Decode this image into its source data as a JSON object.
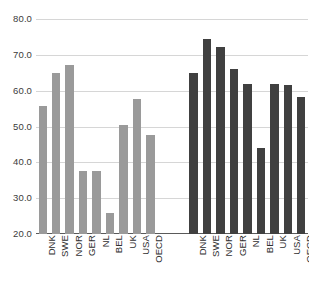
{
  "chart_data": {
    "type": "bar",
    "title": "",
    "subtitle": "",
    "xlabel": "",
    "ylabel": "",
    "ylim": [
      20.0,
      80.0
    ],
    "yticks": [
      "20.0",
      "30.0",
      "40.0",
      "50.0",
      "60.0",
      "70.0",
      "80.0"
    ],
    "ytick_values": [
      20.0,
      30.0,
      40.0,
      50.0,
      60.0,
      70.0,
      80.0
    ],
    "grid": true,
    "legend": "none",
    "categories": [
      "DNK",
      "SWE",
      "NOR",
      "GER",
      "NL",
      "BEL",
      "UK",
      "USA",
      "OECD"
    ],
    "series": [
      {
        "name": "group-1",
        "color": "#9a9a9a",
        "values": [
          55.7,
          65.0,
          67.2,
          37.6,
          37.6,
          26.0,
          50.3,
          57.7,
          47.5
        ],
        "categories": [
          "DNK",
          "SWE",
          "NOR",
          "GER",
          "NL",
          "BEL",
          "UK",
          "USA",
          "OECD"
        ]
      },
      {
        "name": "group-2",
        "color": "#404040",
        "values": [
          64.8,
          74.5,
          72.3,
          66.1,
          61.8,
          44.0,
          61.8,
          61.7,
          58.1
        ],
        "categories": [
          "DNK",
          "SWE",
          "NOR",
          "GER",
          "NL",
          "BEL",
          "UK",
          "USA",
          "OECD"
        ]
      }
    ]
  },
  "colors": {
    "gridline": "#d6d6d6",
    "axis": "#5a5a5a",
    "background": "#ffffff",
    "tick_text": "#3b3b3b"
  }
}
